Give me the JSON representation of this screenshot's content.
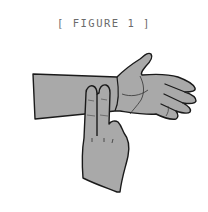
{
  "figure": {
    "caption": "[ FIGURE 1 ]",
    "colors": {
      "skin_fill": "#a9a9a9",
      "outline": "#1a1a1a",
      "caption_text": "#6b6b6b",
      "background": "#ffffff"
    }
  }
}
